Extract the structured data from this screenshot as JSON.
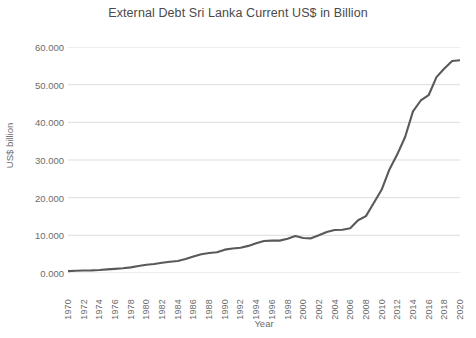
{
  "chart_data": {
    "type": "line",
    "title": "External Debt Sri Lanka Current US$ in Billion",
    "xlabel": "Year",
    "ylabel": "US$ billion",
    "grid": true,
    "legend": false,
    "xlim": [
      1970,
      2020
    ],
    "ylim": [
      0,
      60
    ],
    "ytick_labels": [
      "60.000",
      "50.000",
      "40.000",
      "30.000",
      "20.000",
      "10.000",
      "0.000"
    ],
    "ytick_values": [
      60,
      50,
      40,
      30,
      20,
      10,
      0
    ],
    "xtick_labels": [
      "1970",
      "1972",
      "1974",
      "1976",
      "1978",
      "1980",
      "1982",
      "1984",
      "1986",
      "1988",
      "1990",
      "1992",
      "1994",
      "1996",
      "1998",
      "2000",
      "2002",
      "2004",
      "2006",
      "2008",
      "2010",
      "2012",
      "2014",
      "2016",
      "2018",
      "2020"
    ],
    "x": [
      1970,
      1971,
      1972,
      1973,
      1974,
      1975,
      1976,
      1977,
      1978,
      1979,
      1980,
      1981,
      1982,
      1983,
      1984,
      1985,
      1986,
      1987,
      1988,
      1989,
      1990,
      1991,
      1992,
      1993,
      1994,
      1995,
      1996,
      1997,
      1998,
      1999,
      2000,
      2001,
      2002,
      2003,
      2004,
      2005,
      2006,
      2007,
      2008,
      2009,
      2010,
      2011,
      2012,
      2013,
      2014,
      2015,
      2016,
      2017,
      2018,
      2019,
      2020
    ],
    "values": [
      0.5,
      0.6,
      0.65,
      0.7,
      0.8,
      0.95,
      1.1,
      1.25,
      1.5,
      1.85,
      2.2,
      2.4,
      2.7,
      3.0,
      3.2,
      3.7,
      4.4,
      5.0,
      5.3,
      5.5,
      6.2,
      6.5,
      6.7,
      7.2,
      7.9,
      8.5,
      8.6,
      8.6,
      9.1,
      9.8,
      9.3,
      9.2,
      10.0,
      10.9,
      11.4,
      11.5,
      11.9,
      14.0,
      15.1,
      18.6,
      22.1,
      27.5,
      31.5,
      36.1,
      42.9,
      45.8,
      47.2,
      52.0,
      54.3,
      56.3,
      56.5
    ]
  },
  "series_name": "External Debt",
  "colors": {
    "line": "#595959",
    "grid": "#d9d9d9",
    "text": "#6b6b6b",
    "title": "#4a4a4a",
    "background": "#ffffff"
  }
}
